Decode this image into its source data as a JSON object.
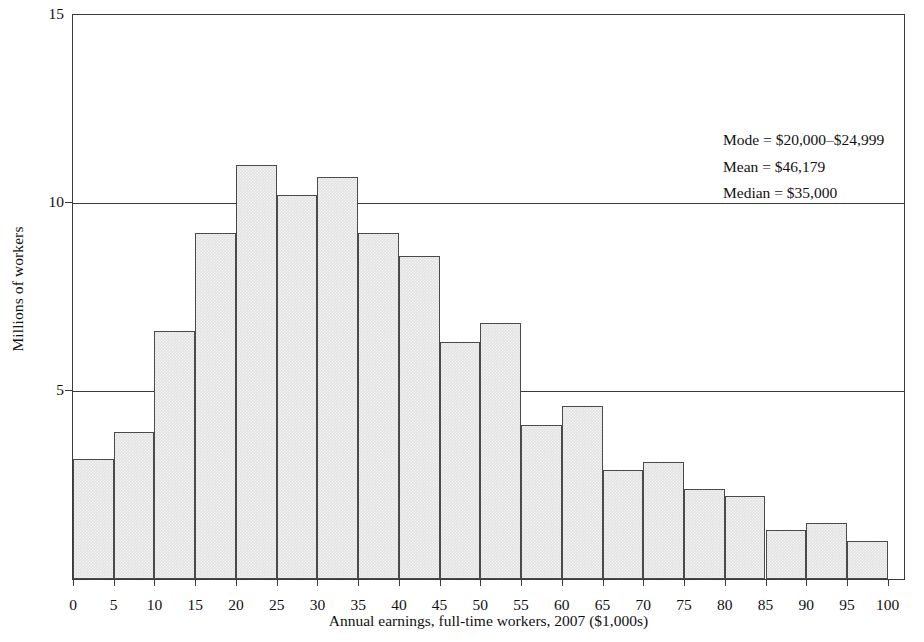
{
  "chart_data": {
    "type": "bar",
    "title": "",
    "xlabel": "Annual earnings, full-time workers, 2007 ($1,000s)",
    "ylabel": "Millions of workers",
    "xlim": [
      0,
      102
    ],
    "ylim": [
      0,
      15
    ],
    "x_tick_labels": [
      "0",
      "5",
      "10",
      "15",
      "20",
      "25",
      "30",
      "35",
      "40",
      "45",
      "50",
      "55",
      "60",
      "65",
      "70",
      "75",
      "80",
      "85",
      "90",
      "95",
      "100"
    ],
    "x_tick_values": [
      0,
      5,
      10,
      15,
      20,
      25,
      30,
      35,
      40,
      45,
      50,
      55,
      60,
      65,
      70,
      75,
      80,
      85,
      90,
      95,
      100
    ],
    "y_tick_labels": [
      "5",
      "10",
      "15"
    ],
    "y_tick_values": [
      5,
      10,
      15
    ],
    "grid": "horizontal gridlines at y = 5, 10, 15",
    "legend": "none",
    "bin_width": 5,
    "bar_fill_color": "#e2e2e2",
    "bar_edge_color": "#4a4a4a",
    "categories": [
      "0-5",
      "5-10",
      "10-15",
      "15-20",
      "20-25",
      "25-30",
      "30-35",
      "35-40",
      "40-45",
      "45-50",
      "50-55",
      "55-60",
      "60-65",
      "65-70",
      "70-75",
      "75-80",
      "80-85",
      "85-90",
      "90-95",
      "95-100"
    ],
    "bin_starts": [
      0,
      5,
      10,
      15,
      20,
      25,
      30,
      35,
      40,
      45,
      50,
      55,
      60,
      65,
      70,
      75,
      80,
      85,
      90,
      95
    ],
    "values": [
      3.2,
      3.9,
      6.6,
      9.2,
      11.0,
      10.2,
      10.7,
      9.2,
      8.6,
      6.3,
      6.8,
      4.1,
      4.6,
      2.9,
      3.1,
      2.4,
      2.2,
      1.3,
      1.5,
      1.0
    ],
    "annotations": [
      "Mode = $20,000–$24,999",
      "Mean = $46,179",
      "Median = $35,000"
    ]
  },
  "stats": {
    "mode_line": "Mode = $20,000–$24,999",
    "mean_line": "Mean = $46,179",
    "median_line": "Median = $35,000"
  }
}
